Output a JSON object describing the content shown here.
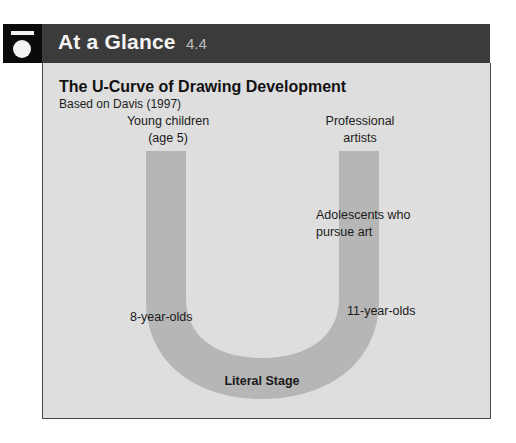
{
  "header": {
    "title": "At a Glance",
    "number": "4.4",
    "icon": "at-a-glance-icon"
  },
  "figure": {
    "title": "The U-Curve of Drawing Development",
    "subtitle": "Based on Davis (1997)",
    "colors": {
      "header_bg": "#3b3b3b",
      "panel_bg": "#dedede",
      "u_curve": "#b6b6b6",
      "icon_bg": "#0a0a0a"
    },
    "labels": {
      "young_children_line1": "Young children",
      "young_children_line2": "(age 5)",
      "professional_line1": "Professional",
      "professional_line2": "artists",
      "adolescents_line1": "Adolescents who",
      "adolescents_line2": "pursue art",
      "eight_year_olds": "8-year-olds",
      "eleven_year_olds": "11-year-olds",
      "literal_stage": "Literal Stage"
    }
  }
}
